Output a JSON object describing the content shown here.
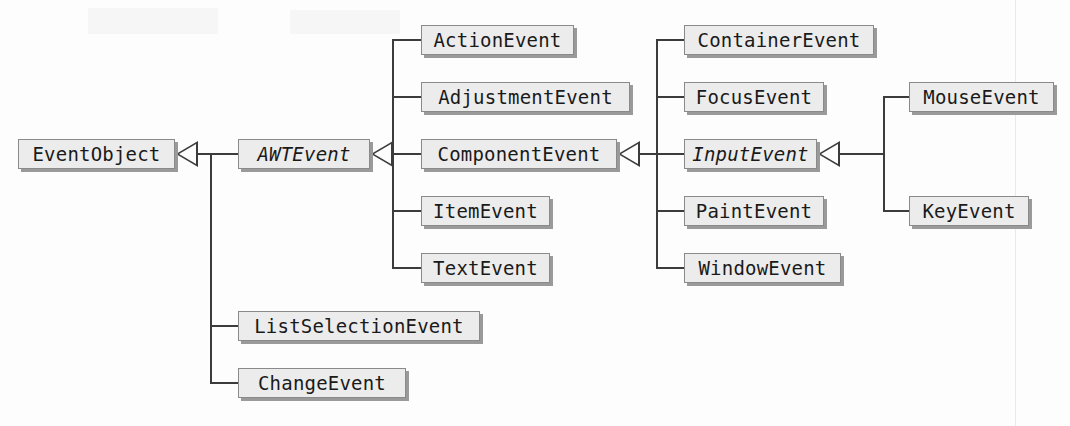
{
  "diagram": {
    "type": "uml-class-hierarchy",
    "background_color": "#fdfdfd",
    "node_fill_color": "#ececec",
    "node_border_color": "#8a8a8a",
    "line_color": "#3c3c3c",
    "shadow_color": "#9a9a9a"
  },
  "nodes": [
    {
      "id": "EventObject",
      "label": "EventObject",
      "abstract": false,
      "x": 18,
      "y": 139,
      "w": 157
    },
    {
      "id": "AWTEvent",
      "label": "AWTEvent",
      "abstract": true,
      "x": 238,
      "y": 139,
      "w": 132
    },
    {
      "id": "ActionEvent",
      "label": "ActionEvent",
      "abstract": false,
      "x": 421,
      "y": 25,
      "w": 153
    },
    {
      "id": "AdjustmentEvent",
      "label": "AdjustmentEvent",
      "abstract": false,
      "x": 421,
      "y": 82,
      "w": 209
    },
    {
      "id": "ComponentEvent",
      "label": "ComponentEvent",
      "abstract": false,
      "x": 421,
      "y": 139,
      "w": 196
    },
    {
      "id": "ItemEvent",
      "label": "ItemEvent",
      "abstract": false,
      "x": 421,
      "y": 196,
      "w": 129
    },
    {
      "id": "TextEvent",
      "label": "TextEvent",
      "abstract": false,
      "x": 421,
      "y": 253,
      "w": 129
    },
    {
      "id": "ContainerEvent",
      "label": "ContainerEvent",
      "abstract": false,
      "x": 684,
      "y": 25,
      "w": 190
    },
    {
      "id": "FocusEvent",
      "label": "FocusEvent",
      "abstract": false,
      "x": 684,
      "y": 82,
      "w": 140
    },
    {
      "id": "InputEvent",
      "label": "InputEvent",
      "abstract": true,
      "x": 684,
      "y": 139,
      "w": 133
    },
    {
      "id": "PaintEvent",
      "label": "PaintEvent",
      "abstract": false,
      "x": 684,
      "y": 196,
      "w": 140
    },
    {
      "id": "WindowEvent",
      "label": "WindowEvent",
      "abstract": false,
      "x": 684,
      "y": 253,
      "w": 157
    },
    {
      "id": "MouseEvent",
      "label": "MouseEvent",
      "abstract": false,
      "x": 909,
      "y": 82,
      "w": 145
    },
    {
      "id": "KeyEvent",
      "label": "KeyEvent",
      "abstract": false,
      "x": 909,
      "y": 196,
      "w": 120
    },
    {
      "id": "ListSelectionEvent",
      "label": "ListSelectionEvent",
      "abstract": false,
      "x": 238,
      "y": 311,
      "w": 242
    },
    {
      "id": "ChangeEvent",
      "label": "ChangeEvent",
      "abstract": false,
      "x": 238,
      "y": 368,
      "w": 168
    }
  ],
  "relations": [
    {
      "parent": "EventObject",
      "children": [
        "AWTEvent",
        "ListSelectionEvent",
        "ChangeEvent"
      ]
    },
    {
      "parent": "AWTEvent",
      "children": [
        "ActionEvent",
        "AdjustmentEvent",
        "ComponentEvent",
        "ItemEvent",
        "TextEvent"
      ]
    },
    {
      "parent": "ComponentEvent",
      "children": [
        "ContainerEvent",
        "FocusEvent",
        "InputEvent",
        "PaintEvent",
        "WindowEvent"
      ]
    },
    {
      "parent": "InputEvent",
      "children": [
        "MouseEvent",
        "KeyEvent"
      ]
    }
  ]
}
